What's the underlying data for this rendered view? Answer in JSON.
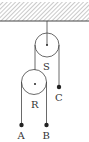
{
  "diagram": {
    "type": "pulley-system",
    "ceiling": {
      "hatched": true
    },
    "pulleys": [
      {
        "id": "S",
        "label": "S"
      },
      {
        "id": "R",
        "label": "R"
      }
    ],
    "masses": [
      {
        "id": "A",
        "label": "A"
      },
      {
        "id": "B",
        "label": "B"
      },
      {
        "id": "C",
        "label": "C"
      }
    ],
    "colors": {
      "line": "#444444",
      "hatch": "#555555",
      "background": "#ffffff"
    }
  }
}
